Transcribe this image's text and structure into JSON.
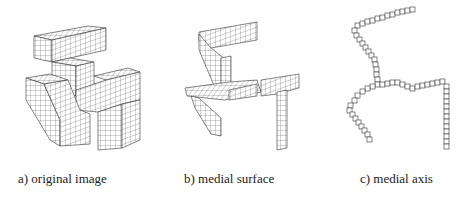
{
  "figure": {
    "panels": [
      {
        "id": "a",
        "caption": "a) original image",
        "content": "3D voxel object (solid)"
      },
      {
        "id": "b",
        "caption": "b) medial surface",
        "content": "voxel medial surface"
      },
      {
        "id": "c",
        "caption": "c) medial axis",
        "content": "voxel medial axis (1-voxel thick curves)"
      }
    ]
  }
}
